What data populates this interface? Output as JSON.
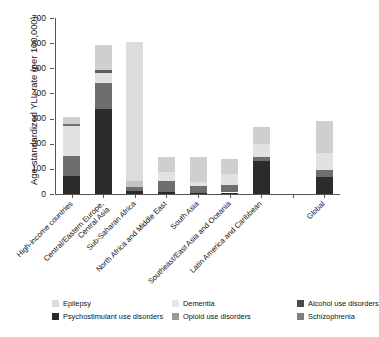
{
  "chart_data": {
    "type": "bar",
    "subtype": "stacked-bar",
    "title": "",
    "xlabel": "",
    "ylabel": "Age-standardized YLL rate (per 100,000)",
    "ylim": [
      0,
      700
    ],
    "yticks": [
      0,
      100,
      200,
      300,
      400,
      500,
      600,
      700
    ],
    "grid": false,
    "legend_position": "bottom",
    "categories": [
      "High-income countries",
      "Central/Eastern Europe, Central Asia",
      "Sub-Saharan Africa",
      "North Africa and Middle East",
      "South Asia",
      "Southeast/East Asia and Oceania",
      "Latin America and Caribbean",
      "Global"
    ],
    "series": [
      {
        "name": "Psychostimulant use disorders",
        "color": "#2b2b2b",
        "values": [
          70,
          340,
          12,
          8,
          4,
          6,
          130,
          68
        ]
      },
      {
        "name": "Alcohol use disorders",
        "color": "#6e6e6e",
        "values": [
          82,
          100,
          14,
          44,
          28,
          31,
          18,
          28
        ]
      },
      {
        "name": "Opioid use disorders",
        "color": "#9a9a9a",
        "values": [
          0,
          0,
          0,
          0,
          0,
          0,
          0,
          0
        ]
      },
      {
        "name": "Schizophrenia",
        "color": "#7d7d7d",
        "values": [
          0,
          0,
          0,
          0,
          0,
          0,
          0,
          0
        ]
      },
      {
        "name": "Dementia",
        "color": "#e2e2e2",
        "values": [
          118,
          42,
          26,
          36,
          14,
          44,
          52,
          69
        ]
      },
      {
        "name": "Epilepsy",
        "color": "#cfcfcf",
        "values": [
          37,
          111,
          551,
          59,
          102,
          57,
          68,
          125
        ]
      }
    ],
    "totals": [
      307,
      593,
      603,
      147,
      148,
      138,
      268,
      290
    ],
    "bars": [
      {
        "category": "High-income countries",
        "total": 307,
        "segments": [
          {
            "series": "Psychostimulant use disorders",
            "from": 0,
            "to": 70,
            "color": "#2b2b2b"
          },
          {
            "series": "Alcohol use disorders",
            "from": 70,
            "to": 152,
            "color": "#6e6e6e"
          },
          {
            "series": "Dementia",
            "from": 152,
            "to": 270,
            "color": "#e2e2e2"
          },
          {
            "series": "Schizophrenia",
            "from": 270,
            "to": 278,
            "color": "#6e6e6e"
          },
          {
            "series": "Epilepsy",
            "from": 278,
            "to": 307,
            "color": "#cfcfcf"
          }
        ]
      },
      {
        "category": "Central/Eastern Europe, Central Asia",
        "total": 593,
        "segments": [
          {
            "series": "Psychostimulant use disorders",
            "from": 0,
            "to": 340,
            "color": "#2b2b2b"
          },
          {
            "series": "Alcohol use disorders",
            "from": 340,
            "to": 440,
            "color": "#6e6e6e"
          },
          {
            "series": "Dementia",
            "from": 440,
            "to": 482,
            "color": "#e2e2e2"
          },
          {
            "series": "Schizophrenia",
            "from": 482,
            "to": 492,
            "color": "#5f5f5f"
          },
          {
            "series": "Epilepsy",
            "from": 492,
            "to": 593,
            "color": "#cfcfcf"
          }
        ]
      },
      {
        "category": "Sub-Saharan Africa",
        "total": 603,
        "segments": [
          {
            "series": "Psychostimulant use disorders",
            "from": 0,
            "to": 12,
            "color": "#2b2b2b"
          },
          {
            "series": "Alcohol use disorders",
            "from": 12,
            "to": 26,
            "color": "#6e6e6e"
          },
          {
            "series": "Dementia",
            "from": 26,
            "to": 52,
            "color": "#c4c4c4"
          },
          {
            "series": "Epilepsy",
            "from": 52,
            "to": 603,
            "color": "#dcdcdc"
          }
        ]
      },
      {
        "category": "North Africa and Middle East",
        "total": 147,
        "segments": [
          {
            "series": "Psychostimulant use disorders",
            "from": 0,
            "to": 8,
            "color": "#2b2b2b"
          },
          {
            "series": "Alcohol use disorders",
            "from": 8,
            "to": 52,
            "color": "#6e6e6e"
          },
          {
            "series": "Dementia",
            "from": 52,
            "to": 88,
            "color": "#e2e2e2"
          },
          {
            "series": "Epilepsy",
            "from": 88,
            "to": 147,
            "color": "#cfcfcf"
          }
        ]
      },
      {
        "category": "South Asia",
        "total": 148,
        "segments": [
          {
            "series": "Psychostimulant use disorders",
            "from": 0,
            "to": 4,
            "color": "#2b2b2b"
          },
          {
            "series": "Alcohol use disorders",
            "from": 4,
            "to": 32,
            "color": "#6e6e6e"
          },
          {
            "series": "Dementia",
            "from": 32,
            "to": 46,
            "color": "#e2e2e2"
          },
          {
            "series": "Epilepsy",
            "from": 46,
            "to": 148,
            "color": "#cfcfcf"
          }
        ]
      },
      {
        "category": "Southeast/East Asia and Oceania",
        "total": 138,
        "segments": [
          {
            "series": "Psychostimulant use disorders",
            "from": 0,
            "to": 6,
            "color": "#2b2b2b"
          },
          {
            "series": "Alcohol use disorders",
            "from": 6,
            "to": 37,
            "color": "#6e6e6e"
          },
          {
            "series": "Dementia",
            "from": 37,
            "to": 81,
            "color": "#e2e2e2"
          },
          {
            "series": "Epilepsy",
            "from": 81,
            "to": 138,
            "color": "#cfcfcf"
          }
        ]
      },
      {
        "category": "Latin America and Caribbean",
        "total": 268,
        "segments": [
          {
            "series": "Psychostimulant use disorders",
            "from": 0,
            "to": 130,
            "color": "#2b2b2b"
          },
          {
            "series": "Alcohol use disorders",
            "from": 130,
            "to": 148,
            "color": "#6e6e6e"
          },
          {
            "series": "Dementia",
            "from": 148,
            "to": 200,
            "color": "#e2e2e2"
          },
          {
            "series": "Epilepsy",
            "from": 200,
            "to": 268,
            "color": "#cfcfcf"
          }
        ]
      },
      {
        "category": "Global",
        "total": 290,
        "segments": [
          {
            "series": "Psychostimulant use disorders",
            "from": 0,
            "to": 68,
            "color": "#2b2b2b"
          },
          {
            "series": "Alcohol use disorders",
            "from": 68,
            "to": 96,
            "color": "#6e6e6e"
          },
          {
            "series": "Dementia",
            "from": 96,
            "to": 165,
            "color": "#e2e2e2"
          },
          {
            "series": "Epilepsy",
            "from": 165,
            "to": 290,
            "color": "#cfcfcf"
          }
        ]
      }
    ],
    "legend": [
      {
        "label": "Epilepsy",
        "color": "#dcdcdc"
      },
      {
        "label": "Psychostimulant use disorders",
        "color": "#2b2b2b"
      },
      {
        "label": "Dementia",
        "color": "#e6e6e6"
      },
      {
        "label": "Opioid use disorders",
        "color": "#9a9a9a"
      },
      {
        "label": "Alcohol use disorders",
        "color": "#4a4a4a"
      },
      {
        "label": "Schizophrenia",
        "color": "#7d7d7d"
      }
    ]
  },
  "axis": {
    "y_title": "Age-standardized YLL rate (per 100,000)",
    "y_tick_labels": [
      "0",
      "100",
      "200",
      "300",
      "400",
      "500",
      "600",
      "700"
    ]
  },
  "x_labels": [
    {
      "lines": [
        "High-income countries"
      ]
    },
    {
      "lines": [
        "Central/Eastern Europe,",
        "Central Asia"
      ]
    },
    {
      "lines": [
        "Sub-Saharan Africa"
      ]
    },
    {
      "lines": [
        "North Africa and Middle East"
      ]
    },
    {
      "lines": [
        "South Asia"
      ]
    },
    {
      "lines": [
        "Southeast/East Asia and Oceania"
      ]
    },
    {
      "lines": [
        "Latin America and Caribbean"
      ]
    },
    {
      "lines": [
        "Global"
      ]
    }
  ]
}
